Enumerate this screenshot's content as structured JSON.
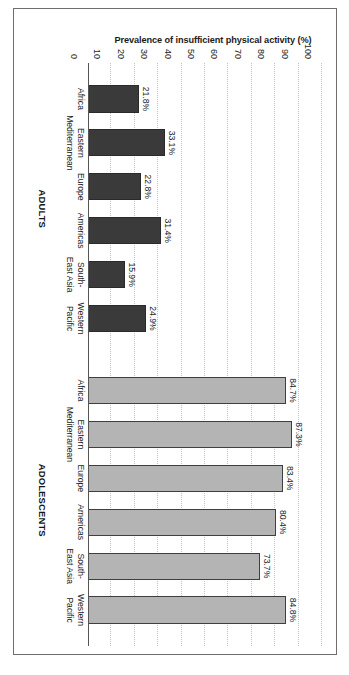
{
  "figure": {
    "axis_title": "Prevalence of insufficient physical activity (%)",
    "caption_partial": ""
  },
  "chart_data": {
    "type": "bar",
    "title": "",
    "xlabel": "",
    "ylabel": "Prevalence of insufficient physical activity (%)",
    "ylim": [
      0,
      100
    ],
    "ytick_labels": [
      "0",
      "10",
      "20",
      "30",
      "40",
      "50",
      "60",
      "70",
      "80",
      "90",
      "100"
    ],
    "ytick_values": [
      0,
      10,
      20,
      30,
      40,
      50,
      60,
      70,
      80,
      90,
      100
    ],
    "grid": "horizontal-dotted",
    "legend_position": "none",
    "groups": [
      {
        "name": "ADULTS",
        "color": "#3a3a3a",
        "categories": [
          "Africa",
          "Eastern Mediterranean",
          "Europe",
          "Americas",
          "South-East Asia",
          "Western Pacific"
        ],
        "category_lines": [
          [
            "Africa",
            ""
          ],
          [
            "Eastern",
            "Mediterranean"
          ],
          [
            "Europe",
            ""
          ],
          [
            "Americas",
            ""
          ],
          [
            "South-",
            "East Asia"
          ],
          [
            "Western",
            "Pacific"
          ]
        ],
        "values": [
          21.8,
          33.1,
          22.8,
          31.4,
          15.9,
          24.9
        ],
        "value_labels": [
          "21.8%",
          "33.1%",
          "22.8%",
          "31.4%",
          "15.9%",
          "24.9%"
        ]
      },
      {
        "name": "ADOLESCENTS",
        "color": "#b4b4b4",
        "categories": [
          "Africa",
          "Eastern Mediterranean",
          "Europe",
          "Americas",
          "South-East Asia",
          "Western Pacific"
        ],
        "category_lines": [
          [
            "Africa",
            ""
          ],
          [
            "Eastern",
            "Mediterranean"
          ],
          [
            "Europe",
            ""
          ],
          [
            "Americas",
            ""
          ],
          [
            "South-",
            "East Asia"
          ],
          [
            "Western",
            "Pacific"
          ]
        ],
        "values": [
          84.7,
          87.3,
          83.4,
          80.4,
          73.7,
          84.8
        ],
        "value_labels": [
          "84.7%",
          "87.3%",
          "83.4%",
          "80.4%",
          "73.7%",
          "84.8%"
        ]
      }
    ]
  }
}
